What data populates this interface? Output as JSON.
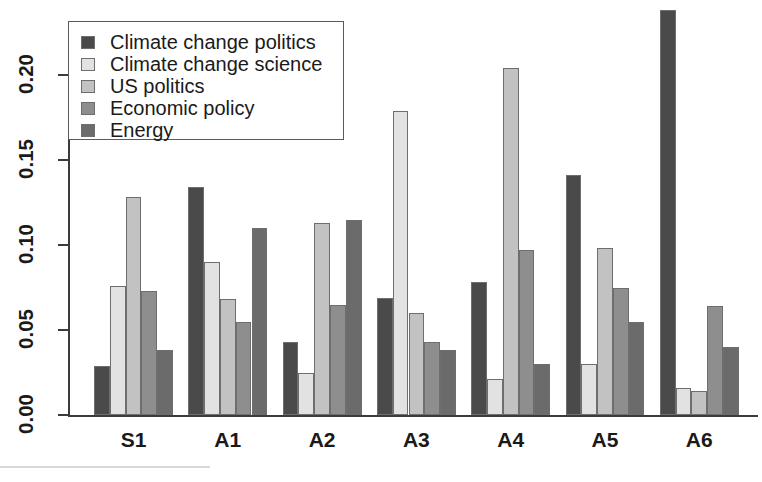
{
  "chart_data": {
    "type": "bar",
    "title": "",
    "subtitle": "",
    "xlabel": "",
    "ylabel": "",
    "grid": false,
    "legend_position": "top-left",
    "categories": [
      "S1",
      "A1",
      "A2",
      "A3",
      "A4",
      "A5",
      "A6"
    ],
    "ylim": [
      0.0,
      0.2425
    ],
    "yticks": [
      0.0,
      0.05,
      0.1,
      0.15,
      0.2
    ],
    "ytick_labels": [
      "0.00",
      "0.05",
      "0.10",
      "0.15",
      "0.20"
    ],
    "series": [
      {
        "name": "Climate change politics",
        "color": "#4a4a4a",
        "values": [
          0.029,
          0.134,
          0.043,
          0.069,
          0.078,
          0.141,
          0.238
        ]
      },
      {
        "name": "Climate change science",
        "color": "#e2e2e2",
        "values": [
          0.076,
          0.09,
          0.025,
          0.179,
          0.021,
          0.03,
          0.016
        ]
      },
      {
        "name": "US politics",
        "color": "#c2c2c2",
        "values": [
          0.128,
          0.068,
          0.113,
          0.06,
          0.204,
          0.098,
          0.014
        ]
      },
      {
        "name": "Economic policy",
        "color": "#8e8e8e",
        "values": [
          0.073,
          0.055,
          0.065,
          0.043,
          0.097,
          0.075,
          0.064
        ]
      },
      {
        "name": "Energy",
        "color": "#6b6b6b",
        "values": [
          0.038,
          0.11,
          0.115,
          0.038,
          0.03,
          0.055,
          0.04
        ]
      }
    ]
  },
  "legend": {
    "entries": [
      {
        "label": "Climate change politics",
        "color": "#4a4a4a"
      },
      {
        "label": "Climate change science",
        "color": "#e2e2e2"
      },
      {
        "label": "US politics",
        "color": "#c2c2c2"
      },
      {
        "label": "Economic policy",
        "color": "#8e8e8e"
      },
      {
        "label": "Energy",
        "color": "#6b6b6b"
      }
    ]
  },
  "axes": {
    "y_tick_labels": [
      "0.00",
      "0.05",
      "0.10",
      "0.15",
      "0.20"
    ],
    "x_tick_labels": [
      "S1",
      "A1",
      "A2",
      "A3",
      "A4",
      "A5",
      "A6"
    ]
  }
}
